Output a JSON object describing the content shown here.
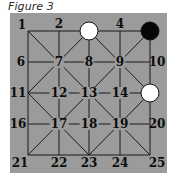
{
  "title": "Figure 3",
  "board": {
    "background_color": "#9b9b9b",
    "grid_x": [
      28,
      59,
      89,
      120,
      150
    ],
    "grid_y": [
      31,
      62,
      93,
      124,
      155
    ],
    "points": [
      {
        "n": "1",
        "x": 22,
        "y": 25
      },
      {
        "n": "2",
        "x": 59,
        "y": 24
      },
      {
        "n": "3",
        "x": 89,
        "y": 24
      },
      {
        "n": "4",
        "x": 120,
        "y": 24
      },
      {
        "n": "5",
        "x": 150,
        "y": 24
      },
      {
        "n": "6",
        "x": 21,
        "y": 62
      },
      {
        "n": "7",
        "x": 59,
        "y": 62
      },
      {
        "n": "8",
        "x": 89,
        "y": 62
      },
      {
        "n": "9",
        "x": 120,
        "y": 62
      },
      {
        "n": "10",
        "x": 157,
        "y": 62
      },
      {
        "n": "11",
        "x": 18,
        "y": 93
      },
      {
        "n": "12",
        "x": 59,
        "y": 93
      },
      {
        "n": "13",
        "x": 89,
        "y": 93
      },
      {
        "n": "14",
        "x": 120,
        "y": 93
      },
      {
        "n": "15",
        "x": 157,
        "y": 93
      },
      {
        "n": "16",
        "x": 18,
        "y": 124
      },
      {
        "n": "17",
        "x": 59,
        "y": 124
      },
      {
        "n": "18",
        "x": 89,
        "y": 124
      },
      {
        "n": "19",
        "x": 120,
        "y": 124
      },
      {
        "n": "20",
        "x": 157,
        "y": 124
      },
      {
        "n": "21",
        "x": 20,
        "y": 163
      },
      {
        "n": "22",
        "x": 59,
        "y": 163
      },
      {
        "n": "23",
        "x": 89,
        "y": 163
      },
      {
        "n": "24",
        "x": 120,
        "y": 163
      },
      {
        "n": "25",
        "x": 157,
        "y": 163
      }
    ],
    "pieces": [
      {
        "point": "3",
        "color": "white",
        "x": 89,
        "y": 31
      },
      {
        "point": "5",
        "color": "black",
        "x": 150,
        "y": 31
      },
      {
        "point": "15",
        "color": "white",
        "x": 150,
        "y": 93
      }
    ],
    "hidden_labels": [
      "3",
      "5",
      "15"
    ]
  }
}
